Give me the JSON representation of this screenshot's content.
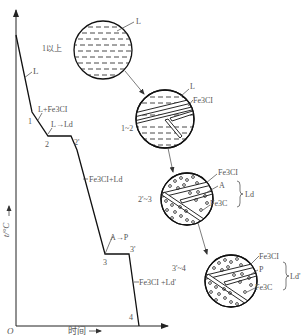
{
  "figure": {
    "type": "cooling-curve-with-microstructures",
    "axes": {
      "y_label": "t/°C",
      "x_label": "时间",
      "origin_label": "O"
    },
    "curve": {
      "segment_labels": {
        "liquid": "L",
        "primary": "L+Fe3CI",
        "eutectic_reaction": "L→Ld",
        "after_eutectic": "Fe3CI+Ld",
        "eutectoid_reaction": "A→P",
        "final": "Fe3CI +Ld'"
      },
      "points": [
        "1",
        "2",
        "2'",
        "3",
        "3'",
        "4"
      ]
    },
    "microstructures": [
      {
        "range_label": "1以上",
        "phases": [
          "L"
        ]
      },
      {
        "range_label": "1~2",
        "phases": [
          "L",
          "Fe3CI"
        ]
      },
      {
        "range_label": "2'~3",
        "phases": [
          "Fe3CI",
          "A",
          "Fe3C"
        ],
        "group_label": "Ld"
      },
      {
        "range_label": "3'~4",
        "phases": [
          "Fe3CI",
          "P",
          "Fe3C"
        ],
        "group_label": "Ld'"
      }
    ]
  }
}
